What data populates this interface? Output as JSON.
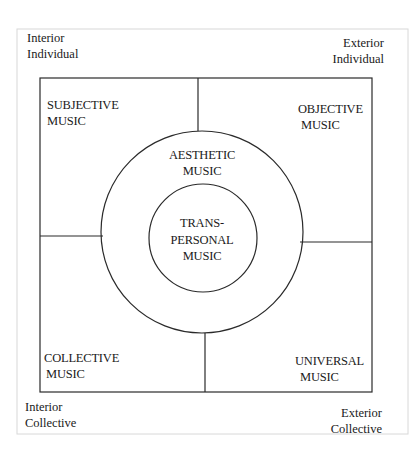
{
  "diagram": {
    "corners": {
      "top_left": [
        "Interior",
        "Individual"
      ],
      "top_right": [
        "Exterior",
        "Individual"
      ],
      "bottom_left": [
        "Interior",
        "Collective"
      ],
      "bottom_right": [
        "Exterior",
        "Collective"
      ]
    },
    "quadrants": {
      "upper_left": [
        "SUBJECTIVE",
        "MUSIC"
      ],
      "upper_right": [
        "OBJECTIVE",
        "MUSIC"
      ],
      "lower_left": [
        "COLLECTIVE",
        "MUSIC"
      ],
      "lower_right": [
        "UNIVERSAL",
        "MUSIC"
      ]
    },
    "outer_circle": [
      "AESTHETIC",
      "MUSIC"
    ],
    "inner_circle": [
      "TRANS-",
      "PERSONAL",
      "MUSIC"
    ],
    "colors": {
      "line": "#2a2a2a",
      "frame": "#d8d8d8",
      "background": "#ffffff"
    }
  }
}
